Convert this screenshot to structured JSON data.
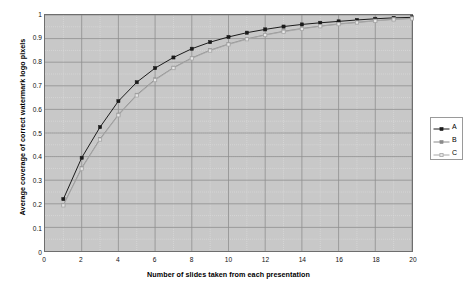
{
  "chart_data": {
    "type": "line",
    "title": "",
    "xlabel": "Number of slides taken from each presentation",
    "ylabel": "Average coverage of correct watermark logo pixels",
    "xlim": [
      0,
      20
    ],
    "ylim": [
      0,
      1
    ],
    "xticks": [
      0,
      2,
      4,
      6,
      8,
      10,
      12,
      14,
      16,
      18,
      20
    ],
    "xtick_labels": [
      "0",
      "2",
      "4",
      "6",
      "8",
      "10",
      "12",
      "14",
      "16",
      "18",
      "20"
    ],
    "yticks": [
      0,
      0.1,
      0.2,
      0.3,
      0.4,
      0.5,
      0.6,
      0.7,
      0.8,
      0.9,
      1
    ],
    "ytick_labels": [
      "0",
      "0.1",
      "0.2",
      "0.3",
      "0.4",
      "0.5",
      "0.6",
      "0.7",
      "0.8",
      "0.9",
      "1"
    ],
    "grid": true,
    "minor_grid": true,
    "plot_background": "#c8c8c8",
    "legend_position": "right",
    "x": [
      1,
      2,
      3,
      4,
      5,
      6,
      7,
      8,
      9,
      10,
      11,
      12,
      13,
      14,
      15,
      16,
      17,
      18,
      19,
      20
    ],
    "series": [
      {
        "name": "A",
        "color": "#1a1a1a",
        "marker": "filled-square",
        "values": [
          0.22,
          0.395,
          0.525,
          0.635,
          0.715,
          0.775,
          0.82,
          0.857,
          0.885,
          0.907,
          0.925,
          0.939,
          0.951,
          0.96,
          0.967,
          0.973,
          0.979,
          0.984,
          0.988,
          0.99
        ]
      },
      {
        "name": "B",
        "color": "#8a8a8a",
        "marker": "filled-square",
        "values": [
          0.195,
          0.352,
          0.475,
          0.578,
          0.662,
          0.727,
          0.777,
          0.818,
          0.851,
          0.877,
          0.899,
          0.916,
          0.931,
          0.943,
          0.953,
          0.962,
          0.969,
          0.976,
          0.982,
          0.986
        ]
      },
      {
        "name": "C",
        "color": "#a8a8a8",
        "marker": "open-square",
        "values": [
          0.193,
          0.349,
          0.472,
          0.575,
          0.659,
          0.724,
          0.775,
          0.816,
          0.849,
          0.875,
          0.897,
          0.915,
          0.929,
          0.941,
          0.952,
          0.961,
          0.968,
          0.975,
          0.981,
          0.985
        ]
      }
    ]
  },
  "legend": {
    "entries": [
      {
        "label": "A"
      },
      {
        "label": "B"
      },
      {
        "label": "C"
      }
    ]
  }
}
